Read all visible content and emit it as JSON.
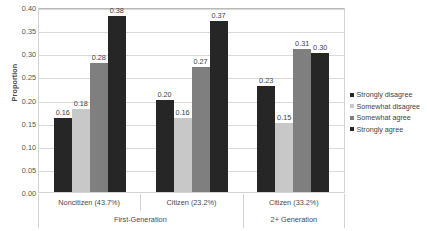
{
  "chart_data": {
    "type": "bar",
    "title": "",
    "subtitle": "",
    "xlabel": "",
    "ylabel": "Proportion",
    "ylim": [
      0,
      0.4
    ],
    "ytick_values": [
      0.4,
      0.35,
      0.3,
      0.25,
      0.2,
      0.15,
      0.1,
      0.05,
      0.0
    ],
    "ytick_labels": [
      "0.40",
      "0.35",
      "0.30",
      "0.25",
      "0.20",
      "0.15",
      "0.10",
      "0.05",
      "0.00"
    ],
    "grid": true,
    "legend_position": "right",
    "categories": [
      "Noncitizen (43.7%)",
      "Citizen (23.2%)",
      "Citizen (33.2%)"
    ],
    "supercategories": [
      "First-Generation",
      "2+ Generation"
    ],
    "supercategory_spans": [
      2,
      1
    ],
    "series": [
      {
        "name": "Strongly disagree",
        "color": "#262626",
        "values": [
          0.16,
          0.2,
          0.23
        ],
        "labels": [
          "0.16",
          "0.20",
          "0.23"
        ]
      },
      {
        "name": "Somewhat disagree",
        "color": "#c8c8c8",
        "values": [
          0.18,
          0.16,
          0.15
        ],
        "labels": [
          "0.18",
          "0.16",
          "0.15"
        ]
      },
      {
        "name": "Somewhat agree",
        "color": "#7f7f7f",
        "values": [
          0.28,
          0.27,
          0.31
        ],
        "labels": [
          "0.28",
          "0.27",
          "0.31"
        ]
      },
      {
        "name": "Strongly agree",
        "color": "#262626",
        "values": [
          0.38,
          0.37,
          0.3
        ],
        "labels": [
          "0.38",
          "0.37",
          "0.30"
        ]
      }
    ]
  },
  "legend": {
    "items": [
      {
        "label": "Strongly disagree",
        "color": "#262626"
      },
      {
        "label": "Somewhat disagree",
        "color": "#c8c8c8"
      },
      {
        "label": "Somewhat agree",
        "color": "#7f7f7f"
      },
      {
        "label": "Strongly agree",
        "color": "#262626"
      }
    ]
  },
  "axes": {
    "y_title": "Proportion"
  }
}
